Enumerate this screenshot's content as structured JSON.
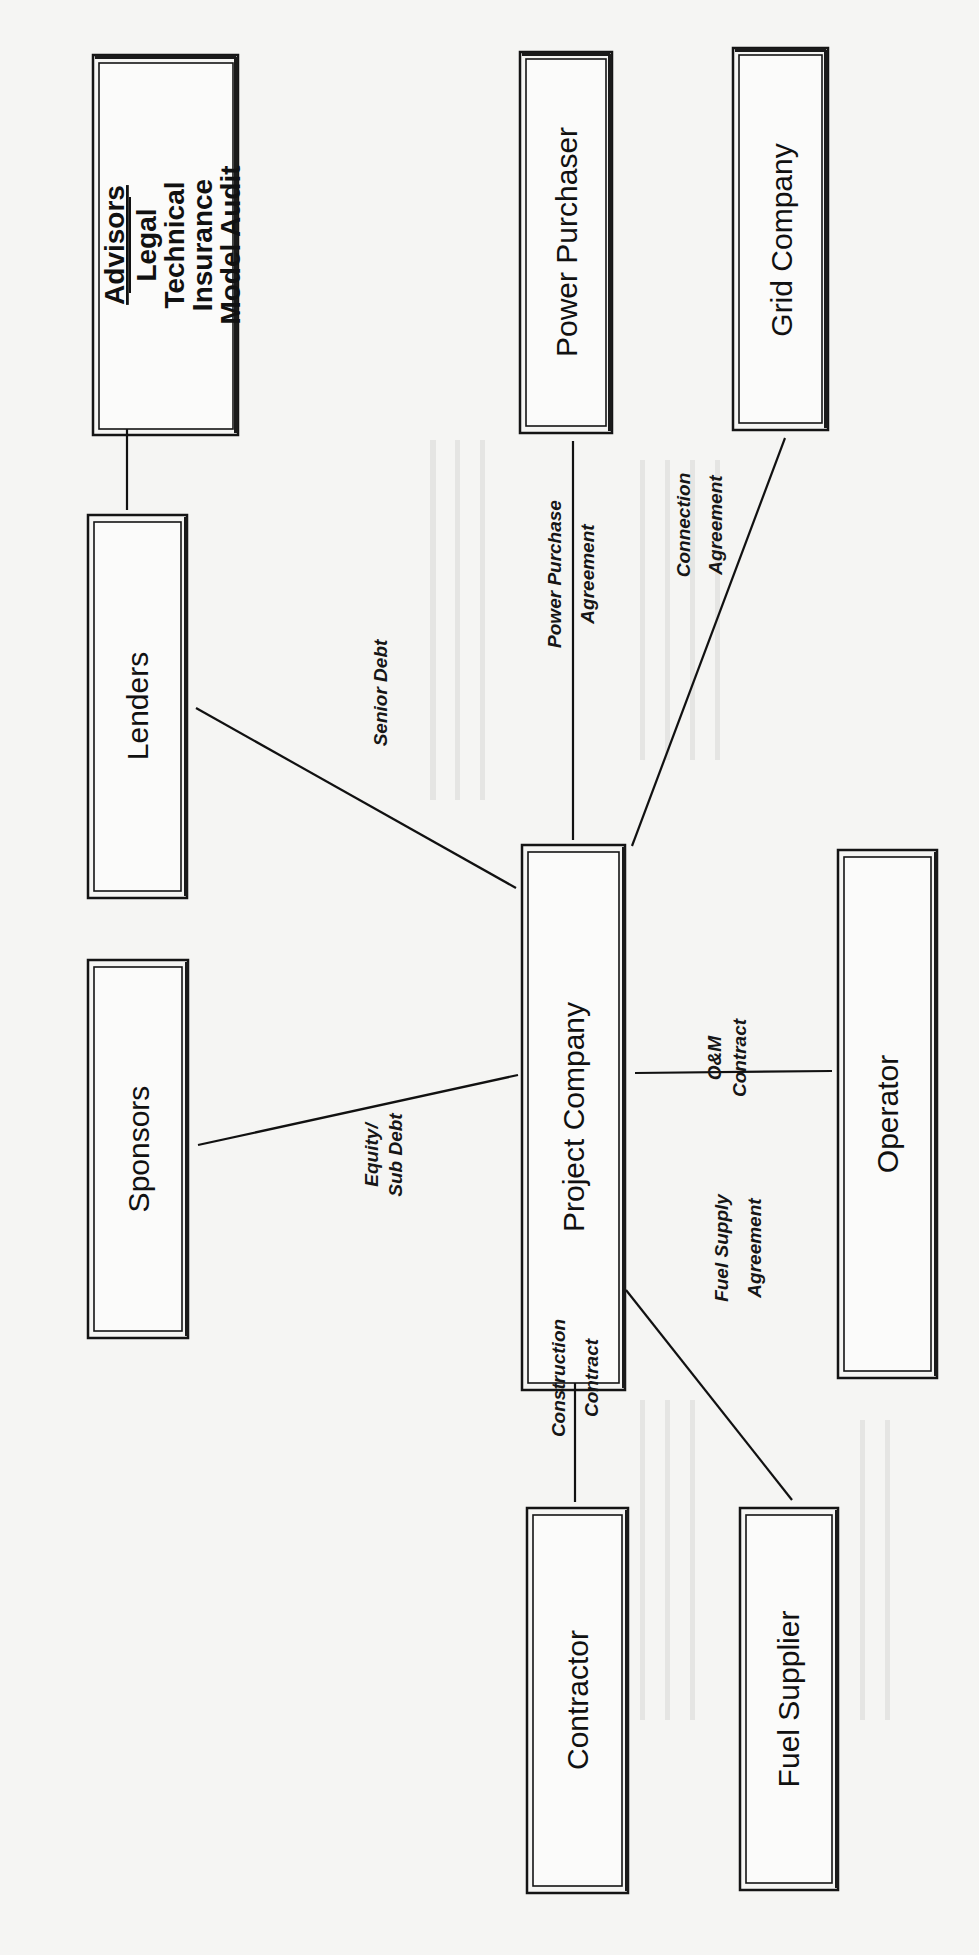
{
  "diagram": {
    "orientation": "rotated-90-ccw",
    "colors": {
      "ink": "#111111",
      "paper": "#f5f5f3",
      "box_fill": "#fbfbfa"
    },
    "entities": {
      "advisors": {
        "heading": "Advisors",
        "items": [
          "Legal",
          "Technical",
          "Insurance",
          "Model Audit"
        ],
        "box": {
          "x": 93,
          "y": 55,
          "w": 145,
          "h": 380
        }
      },
      "power_purchaser": {
        "label": "Power Purchaser",
        "box": {
          "x": 520,
          "y": 52,
          "w": 92,
          "h": 381
        }
      },
      "grid_company": {
        "label": "Grid Company",
        "box": {
          "x": 733,
          "y": 48,
          "w": 95,
          "h": 382
        }
      },
      "lenders": {
        "label": "Lenders",
        "box": {
          "x": 88,
          "y": 515,
          "w": 99,
          "h": 383
        }
      },
      "sponsors": {
        "label": "Sponsors",
        "box": {
          "x": 88,
          "y": 960,
          "w": 100,
          "h": 378
        }
      },
      "project_company": {
        "label": "Project Company",
        "box": {
          "x": 522,
          "y": 845,
          "w": 103,
          "h": 545
        }
      },
      "operator": {
        "label": "Operator",
        "box": {
          "x": 838,
          "y": 850,
          "w": 99,
          "h": 528
        }
      },
      "contractor": {
        "label": "Contractor",
        "box": {
          "x": 527,
          "y": 1508,
          "w": 101,
          "h": 385
        }
      },
      "fuel_supplier": {
        "label": "Fuel Supplier",
        "box": {
          "x": 740,
          "y": 1508,
          "w": 98,
          "h": 382
        }
      }
    },
    "relationships": [
      {
        "id": "senior_debt",
        "from": "Lenders",
        "to": "Project Company",
        "lines": [
          "Senior Debt"
        ]
      },
      {
        "id": "equity_sub_debt",
        "from": "Sponsors",
        "to": "Project Company",
        "lines": [
          "Equity/",
          "Sub Debt"
        ]
      },
      {
        "id": "power_purchase_agreement",
        "from": "Power Purchaser",
        "to": "Project Company",
        "lines": [
          "Power Purchase",
          "Agreement"
        ]
      },
      {
        "id": "connection_agreement",
        "from": "Grid Company",
        "to": "Project Company",
        "lines": [
          "Connection",
          "Agreement"
        ]
      },
      {
        "id": "om_contract",
        "from": "Operator",
        "to": "Project Company",
        "lines": [
          "O&M",
          "Contract"
        ]
      },
      {
        "id": "construction_contract",
        "from": "Contractor",
        "to": "Project Company",
        "lines": [
          "Construction",
          "Contract"
        ]
      },
      {
        "id": "fuel_supply_agreement",
        "from": "Fuel Supplier",
        "to": "Project Company",
        "lines": [
          "Fuel Supply",
          "Agreement"
        ]
      },
      {
        "id": "advisors_link",
        "from": "Advisors",
        "to": "Lenders",
        "lines": []
      }
    ]
  }
}
